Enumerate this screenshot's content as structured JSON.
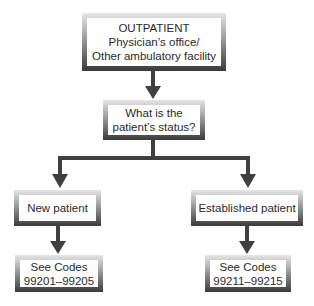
{
  "nodes": {
    "outpatient": {
      "lines": [
        "OUTPATIENT",
        "Physician’s office/",
        "Other ambulatory facility"
      ]
    },
    "status_question": {
      "lines": [
        "What is the",
        "patient’s status?"
      ]
    },
    "new_patient": {
      "lines": [
        "New patient"
      ]
    },
    "established_patient": {
      "lines": [
        "Established patient"
      ]
    },
    "new_codes": {
      "lines": [
        "See Codes",
        "99201–99205"
      ]
    },
    "established_codes": {
      "lines": [
        "See Codes",
        "99211–99215"
      ]
    }
  },
  "edges": [
    {
      "from": "outpatient",
      "to": "status_question"
    },
    {
      "from": "status_question",
      "to": "new_patient"
    },
    {
      "from": "status_question",
      "to": "established_patient"
    },
    {
      "from": "new_patient",
      "to": "new_codes"
    },
    {
      "from": "established_patient",
      "to": "established_codes"
    }
  ],
  "colors": {
    "arrow": "#404040",
    "frame_dark": "#3a3a3a",
    "frame_light": "#e6e6e6"
  }
}
